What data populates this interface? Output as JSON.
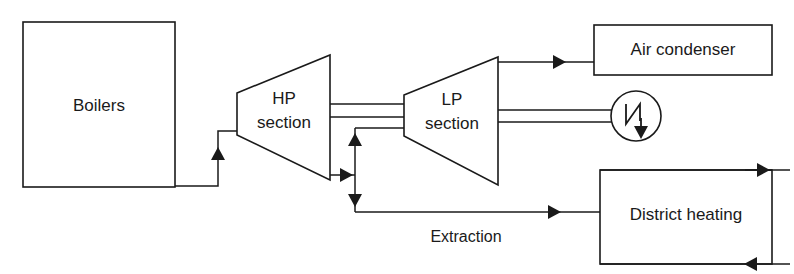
{
  "diagram": {
    "background_color": "#ffffff",
    "line_color": "#1a1a1a",
    "nodes": {
      "boilers": {
        "label": "Boilers",
        "shape": "rectangle"
      },
      "hp_section": {
        "label_line1": "HP",
        "label_line2": "section",
        "shape": "trapezoid"
      },
      "lp_section": {
        "label_line1": "LP",
        "label_line2": "section",
        "shape": "trapezoid"
      },
      "air_condenser": {
        "label": "Air condenser",
        "shape": "rectangle"
      },
      "district_heating": {
        "label": "District heating",
        "shape": "rectangle"
      },
      "generator": {
        "label": "",
        "shape": "circle",
        "symbol": "generator-zigzag-arrow"
      }
    },
    "edges": {
      "extraction": {
        "label": "Extraction"
      }
    }
  }
}
